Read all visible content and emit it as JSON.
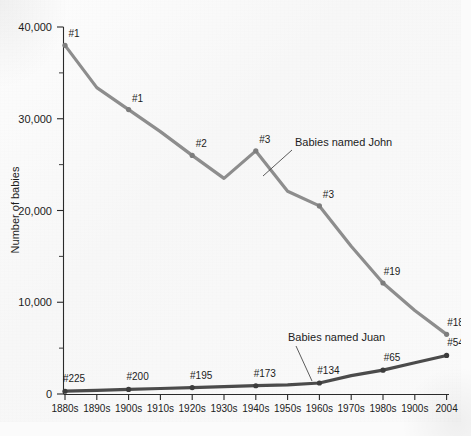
{
  "chart_data": {
    "type": "line",
    "title": "",
    "xlabel": "",
    "ylabel": "Number of babies",
    "categories": [
      "1880s",
      "1890s",
      "1900s",
      "1910s",
      "1920s",
      "1930s",
      "1940s",
      "1950s",
      "1960s",
      "1970s",
      "1980s",
      "1900s",
      "2004"
    ],
    "ylim": [
      0,
      40000
    ],
    "yticks": [
      0,
      10000,
      20000,
      30000,
      40000
    ],
    "ytick_labels": [
      "0",
      "10,000",
      "20,000",
      "30,000",
      "40,000"
    ],
    "minor_ticks": [
      5000,
      15000,
      25000,
      35000
    ],
    "grid": false,
    "legend_position": "inline-annotation",
    "series": [
      {
        "name": "Babies named John",
        "color": "#8d8d8d",
        "values": [
          38000,
          33400,
          31000,
          28600,
          26000,
          23500,
          26500,
          22100,
          20500,
          16100,
          12100,
          9100,
          6500
        ],
        "rank_labels": [
          "#1",
          "",
          "#1",
          "",
          "#2",
          "",
          "#3",
          "",
          "#3",
          "",
          "#19",
          "",
          "#18"
        ]
      },
      {
        "name": "Babies named Juan",
        "color": "#4b4b4b",
        "values": [
          300,
          400,
          500,
          600,
          700,
          800,
          900,
          1000,
          1200,
          2000,
          2600,
          3400,
          4200
        ],
        "rank_labels": [
          "#225",
          "",
          "#200",
          "",
          "#195",
          "",
          "#173",
          "",
          "#134",
          "",
          "#65",
          "",
          "#54"
        ]
      }
    ],
    "annotations": [
      {
        "text": "Babies named John",
        "x": 295,
        "y": 146
      },
      {
        "text": "Babies named Juan",
        "x": 288,
        "y": 341
      }
    ]
  }
}
